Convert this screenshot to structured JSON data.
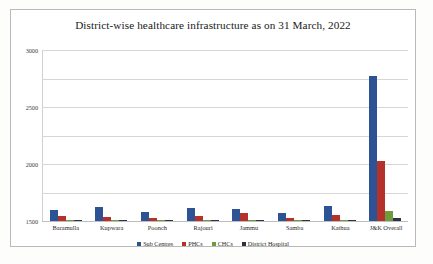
{
  "chart_data": {
    "type": "bar",
    "title": "District-wise healthcare infrastructure as on 31 March, 2022",
    "xlabel": "",
    "ylabel": "",
    "ylim": [
      0,
      3000
    ],
    "yticks": [
      0,
      500,
      1000,
      1500,
      2000,
      2500,
      3000
    ],
    "ytick_labels": [
      "0",
      "500",
      "1000",
      "1500",
      "2000",
      "2500",
      "3000"
    ],
    "grid": true,
    "legend_position": "bottom",
    "categories": [
      "Baramulla",
      "Kupwara",
      "Poonch",
      "Rajouri",
      "Jammu",
      "Samba",
      "Kathua",
      "J&K Overall"
    ],
    "series": [
      {
        "name": "Sub Centres",
        "color": "#2e5395",
        "values": [
          185,
          245,
          150,
          230,
          210,
          135,
          265,
          2550
        ]
      },
      {
        "name": "PHCs",
        "color": "#b4322a",
        "values": [
          85,
          70,
          55,
          95,
          145,
          45,
          110,
          1050
        ]
      },
      {
        "name": "CHCs",
        "color": "#6e9b3c",
        "values": [
          10,
          8,
          6,
          9,
          14,
          5,
          11,
          175
        ]
      },
      {
        "name": "District Hospital",
        "color": "#2f2f46",
        "values": [
          2,
          2,
          1,
          2,
          3,
          1,
          2,
          60
        ]
      }
    ]
  }
}
